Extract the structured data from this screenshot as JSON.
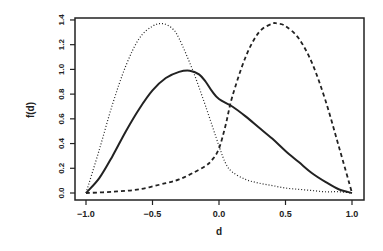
{
  "chart_data": {
    "type": "line",
    "title": "",
    "xlabel": "d",
    "ylabel": "f(d)",
    "xlim": [
      -1.05,
      1.07
    ],
    "ylim": [
      -0.05,
      1.42
    ],
    "x_ticks": [
      "-1.0",
      "-0.5",
      "0.0",
      "0.5",
      "1.0"
    ],
    "x_tick_values": [
      -1.0,
      -0.5,
      0.0,
      0.5,
      1.0
    ],
    "y_ticks": [
      "0.0",
      "0.2",
      "0.4",
      "0.6",
      "0.8",
      "1.0",
      "1.2",
      "1.4"
    ],
    "y_tick_values": [
      0.0,
      0.2,
      0.4,
      0.6,
      0.8,
      1.0,
      1.2,
      1.4
    ],
    "grid": false,
    "legend": null,
    "series": [
      {
        "name": "solid",
        "style": "solid",
        "x": [
          -1.0,
          -0.9,
          -0.8,
          -0.7,
          -0.6,
          -0.5,
          -0.4,
          -0.3,
          -0.22,
          -0.15,
          -0.1,
          -0.05,
          0.0,
          0.1,
          0.2,
          0.3,
          0.4,
          0.5,
          0.6,
          0.7,
          0.8,
          0.9,
          1.0
        ],
        "y": [
          0.0,
          0.12,
          0.3,
          0.5,
          0.68,
          0.83,
          0.93,
          0.98,
          0.99,
          0.96,
          0.9,
          0.82,
          0.76,
          0.7,
          0.62,
          0.53,
          0.44,
          0.34,
          0.25,
          0.16,
          0.09,
          0.03,
          0.0
        ]
      },
      {
        "name": "dotted",
        "style": "dotted",
        "x": [
          -1.0,
          -0.9,
          -0.8,
          -0.7,
          -0.6,
          -0.5,
          -0.42,
          -0.35,
          -0.3,
          -0.2,
          -0.1,
          0.0,
          0.05,
          0.1,
          0.2,
          0.3,
          0.4,
          0.5,
          0.6,
          0.7,
          0.8,
          0.9,
          1.0
        ],
        "y": [
          0.0,
          0.35,
          0.72,
          1.03,
          1.25,
          1.35,
          1.37,
          1.33,
          1.25,
          1.0,
          0.7,
          0.38,
          0.24,
          0.17,
          0.11,
          0.08,
          0.06,
          0.04,
          0.03,
          0.02,
          0.01,
          0.01,
          0.0
        ]
      },
      {
        "name": "dashed",
        "style": "dashed",
        "x": [
          -1.0,
          -0.8,
          -0.6,
          -0.4,
          -0.3,
          -0.2,
          -0.1,
          -0.05,
          0.0,
          0.05,
          0.1,
          0.2,
          0.3,
          0.4,
          0.44,
          0.5,
          0.6,
          0.7,
          0.8,
          0.9,
          1.0
        ],
        "y": [
          0.0,
          0.01,
          0.03,
          0.08,
          0.11,
          0.16,
          0.22,
          0.27,
          0.36,
          0.55,
          0.78,
          1.1,
          1.3,
          1.37,
          1.37,
          1.35,
          1.25,
          1.05,
          0.75,
          0.38,
          0.0
        ]
      }
    ]
  }
}
